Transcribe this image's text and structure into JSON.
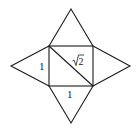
{
  "diagram": {
    "stroke_color": "#1a1a1a",
    "background": "#ffffff",
    "square": {
      "x1": 49,
      "y1": 46,
      "x2": 93,
      "y2": 86
    },
    "apexes": {
      "top": [
        71,
        9
      ],
      "left": [
        11,
        66
      ],
      "right": [
        130,
        66
      ],
      "bottom": [
        71,
        123
      ]
    },
    "diagonal": {
      "from": [
        49,
        46
      ],
      "to": [
        93,
        86
      ]
    },
    "labels": {
      "left_side": "1",
      "bottom_side": "1",
      "diagonal_radical": "√",
      "diagonal_value": "2"
    }
  }
}
